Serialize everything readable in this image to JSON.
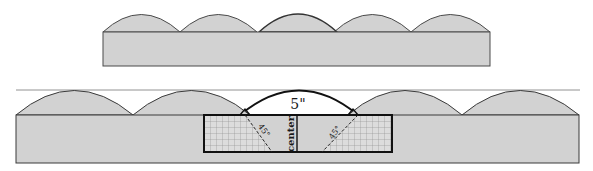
{
  "diagram": {
    "title": "",
    "colors": {
      "fill": "#d2d2d2",
      "outline": "#4a4a4a",
      "bold_outline": "#1a1a1a",
      "grid": "#8a8a8a",
      "background": "#ffffff"
    },
    "top_figure": {
      "description": "Band with five overlapping half-arches",
      "arch_count": 5,
      "highlighted_arch_index": 2
    },
    "bottom_figure": {
      "description": "Enlarged band with gray arches and a white center arch over a gridded box",
      "arch_count": 5,
      "center_arch_label": "5\"",
      "center_label": "center",
      "left_angle_label": "45°",
      "right_angle_label": "45°"
    }
  }
}
